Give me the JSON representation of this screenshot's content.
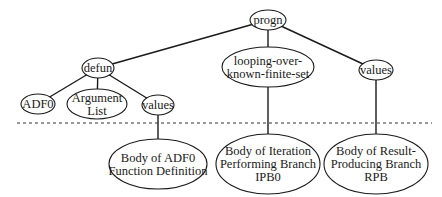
{
  "diagram": {
    "type": "tree",
    "nodes": [
      {
        "id": "progn",
        "lines": [
          "progn"
        ],
        "cx": 268,
        "cy": 20,
        "rx": 18,
        "ry": 10
      },
      {
        "id": "defun",
        "lines": [
          "defun"
        ],
        "cx": 98,
        "cy": 68,
        "rx": 16,
        "ry": 10
      },
      {
        "id": "looping",
        "lines": [
          "looping-over-",
          "known-finite-set"
        ],
        "cx": 268,
        "cy": 67,
        "rx": 46,
        "ry": 20
      },
      {
        "id": "values-right",
        "lines": [
          "values"
        ],
        "cx": 376,
        "cy": 70,
        "rx": 17,
        "ry": 10
      },
      {
        "id": "adf0",
        "lines": [
          "ADF0"
        ],
        "cx": 38,
        "cy": 104,
        "rx": 17,
        "ry": 10
      },
      {
        "id": "argument-list",
        "lines": [
          "Argument",
          "List"
        ],
        "cx": 97,
        "cy": 104,
        "rx": 30,
        "ry": 15
      },
      {
        "id": "values-left",
        "lines": [
          "values"
        ],
        "cx": 158,
        "cy": 105,
        "rx": 16,
        "ry": 10
      },
      {
        "id": "body-adf0",
        "lines": [
          "Body of ADF0",
          "Function Definition"
        ],
        "cx": 158,
        "cy": 164,
        "rx": 49,
        "ry": 25
      },
      {
        "id": "body-ipb0",
        "lines": [
          "Body of Iteration",
          "Performing Branch",
          "IPB0"
        ],
        "cx": 268,
        "cy": 164,
        "rx": 52,
        "ry": 30
      },
      {
        "id": "body-rpb",
        "lines": [
          "Body of Result-",
          "Producing Branch",
          "RPB"
        ],
        "cx": 376,
        "cy": 164,
        "rx": 52,
        "ry": 30
      }
    ],
    "edges": [
      {
        "from": "progn",
        "to": "defun"
      },
      {
        "from": "progn",
        "to": "looping"
      },
      {
        "from": "progn",
        "to": "values-right"
      },
      {
        "from": "defun",
        "to": "adf0"
      },
      {
        "from": "defun",
        "to": "argument-list"
      },
      {
        "from": "defun",
        "to": "values-left"
      },
      {
        "from": "values-left",
        "to": "body-adf0"
      },
      {
        "from": "looping",
        "to": "body-ipb0"
      },
      {
        "from": "values-right",
        "to": "body-rpb"
      }
    ],
    "divider": {
      "y": 123,
      "x1": 17,
      "x2": 432,
      "style": "dashed"
    },
    "line_height": 13
  }
}
